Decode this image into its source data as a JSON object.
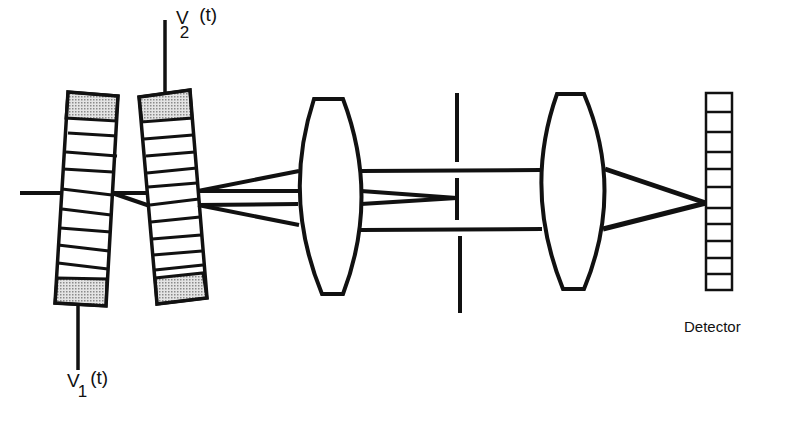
{
  "diagram": {
    "type": "optical setup schematic",
    "components": [
      {
        "id": "modulator-1",
        "kind": "acousto-optic modulator (segmented cell)",
        "drive_label": "V1(t)"
      },
      {
        "id": "modulator-2",
        "kind": "acousto-optic modulator (segmented cell)",
        "drive_label": "V2(t)"
      },
      {
        "id": "lens-1",
        "kind": "biconvex lens"
      },
      {
        "id": "aperture",
        "kind": "spatial filter / slit"
      },
      {
        "id": "lens-2",
        "kind": "biconvex lens"
      },
      {
        "id": "detector",
        "kind": "detector array",
        "cells": 11
      }
    ],
    "colors": {
      "stroke": "#111111",
      "cap_fill": "#bdbdbd",
      "background": "#ffffff"
    }
  },
  "labels": {
    "v1": {
      "main": "V",
      "sub": "1",
      "arg": "(t)"
    },
    "v2": {
      "main": "V",
      "sub": "2",
      "arg": "(t)"
    },
    "detector": "Detector"
  }
}
